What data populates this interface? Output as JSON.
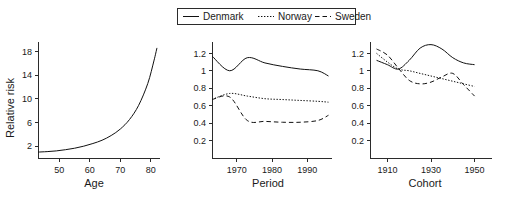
{
  "figure": {
    "legend": {
      "position": "top-center",
      "entries": [
        {
          "label": "Denmark",
          "style": "solid",
          "color": "#111111"
        },
        {
          "label": "Norway",
          "style": "dotted",
          "color": "#111111"
        },
        {
          "label": "Sweden",
          "style": "dashed",
          "color": "#111111"
        }
      ]
    },
    "shared_ylabel": "Relative risk"
  },
  "chart_data": [
    {
      "type": "line",
      "panel": "age",
      "title": "",
      "xlabel": "Age",
      "ylabel": "Relative risk",
      "xlim": [
        43,
        83
      ],
      "ylim": [
        0,
        19.6
      ],
      "xticks": [
        50,
        60,
        70,
        80
      ],
      "yticks": [
        2,
        6,
        10,
        14,
        18
      ],
      "grid": false,
      "series": [
        {
          "name": "Denmark",
          "style": "solid",
          "x": [
            43,
            46,
            49,
            52,
            55,
            58,
            61,
            64,
            67,
            70,
            73,
            76,
            79,
            81,
            82
          ],
          "values": [
            1.0,
            1.08,
            1.2,
            1.4,
            1.65,
            2.0,
            2.45,
            3.0,
            3.8,
            4.9,
            6.5,
            8.9,
            12.6,
            16.4,
            18.6
          ]
        }
      ]
    },
    {
      "type": "line",
      "panel": "period",
      "title": "",
      "xlabel": "Period",
      "ylabel": "Relative risk",
      "xlim": [
        1963,
        1997
      ],
      "ylim": [
        0,
        1.33
      ],
      "xticks": [
        1970,
        1980,
        1990
      ],
      "yticks": [
        0.2,
        0.4,
        0.6,
        0.8,
        1,
        1.2
      ],
      "grid": false,
      "series": [
        {
          "name": "Denmark",
          "style": "solid",
          "x": [
            1963,
            1968,
            1973,
            1978,
            1983,
            1988,
            1993,
            1996
          ],
          "values": [
            1.17,
            1.0,
            1.15,
            1.09,
            1.05,
            1.02,
            1.0,
            0.94
          ]
        },
        {
          "name": "Norway",
          "style": "dotted",
          "x": [
            1963,
            1968,
            1973,
            1978,
            1983,
            1988,
            1993,
            1996
          ],
          "values": [
            0.67,
            0.74,
            0.71,
            0.68,
            0.67,
            0.66,
            0.65,
            0.64
          ]
        },
        {
          "name": "Sweden",
          "style": "dashed",
          "x": [
            1963,
            1968,
            1973,
            1978,
            1983,
            1988,
            1993,
            1996
          ],
          "values": [
            0.67,
            0.7,
            0.43,
            0.42,
            0.41,
            0.41,
            0.43,
            0.49
          ]
        }
      ]
    },
    {
      "type": "line",
      "panel": "cohort",
      "title": "",
      "xlabel": "Cohort",
      "ylabel": "Relative risk",
      "xlim": [
        1902,
        1958
      ],
      "ylim": [
        0,
        1.33
      ],
      "xticks": [
        1910,
        1930,
        1950
      ],
      "yticks": [
        0.2,
        0.4,
        0.6,
        0.8,
        1,
        1.2
      ],
      "grid": false,
      "series": [
        {
          "name": "Denmark",
          "style": "solid",
          "x": [
            1905,
            1910,
            1915,
            1920,
            1925,
            1930,
            1935,
            1940,
            1945,
            1950
          ],
          "values": [
            1.12,
            1.07,
            1.02,
            1.12,
            1.26,
            1.3,
            1.25,
            1.15,
            1.09,
            1.07
          ]
        },
        {
          "name": "Norway",
          "style": "dotted",
          "x": [
            1905,
            1910,
            1915,
            1920,
            1925,
            1930,
            1935,
            1940,
            1945,
            1950
          ],
          "values": [
            1.2,
            1.1,
            1.02,
            1.0,
            0.97,
            0.94,
            0.91,
            0.88,
            0.85,
            0.82
          ]
        },
        {
          "name": "Sweden",
          "style": "dashed",
          "x": [
            1905,
            1910,
            1915,
            1920,
            1925,
            1930,
            1935,
            1940,
            1945,
            1950
          ],
          "values": [
            1.25,
            1.18,
            1.03,
            0.89,
            0.85,
            0.87,
            0.93,
            0.97,
            0.84,
            0.71
          ]
        }
      ]
    }
  ]
}
